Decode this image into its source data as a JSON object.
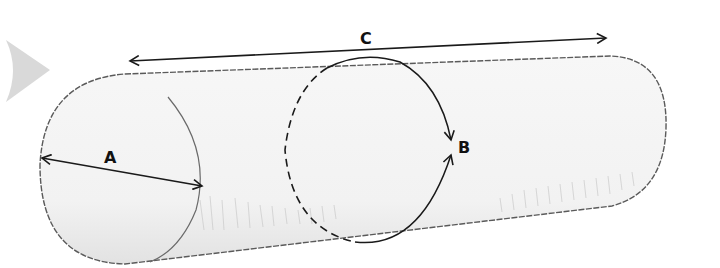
{
  "diagram": {
    "labels": {
      "a": "A",
      "b": "B",
      "c": "C"
    },
    "dimensions": [
      {
        "label": "A",
        "meaning": "diameter of end face"
      },
      {
        "label": "B",
        "meaning": "circumference around cylinder"
      },
      {
        "label": "C",
        "meaning": "length of cylinder"
      }
    ],
    "colors": {
      "outline": "#555555",
      "arrow": "#1a1a1a",
      "fill": "#f6f6f6",
      "shading": "#cfcfcf",
      "nav_triangle": "#d9d9d9"
    }
  }
}
